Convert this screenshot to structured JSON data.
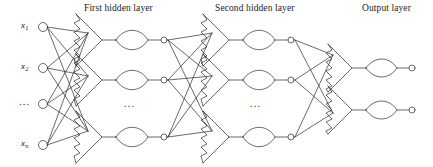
{
  "figure": {
    "type": "diagram",
    "background_color": "#ffffff",
    "stroke_color": "#2a2a2a"
  },
  "titles": {
    "first_hidden": "First hidden layer",
    "second_hidden": "Second hidden layer",
    "output": "Output layer"
  },
  "input_layer": {
    "labels": [
      {
        "base": "x",
        "sub": "1"
      },
      {
        "base": "x",
        "sub": "2"
      },
      {
        "base": "",
        "sub": ""
      },
      {
        "base": "x",
        "sub": "n"
      }
    ],
    "ellipsis": "...",
    "node_count_visible": 4
  },
  "ellipses": {
    "first_hidden": "...",
    "second_hidden": "...",
    "input": "..."
  },
  "layers": [
    {
      "name": "input",
      "nodes": 4,
      "x": 42
    },
    {
      "name": "first-hidden",
      "nodes": 3,
      "x": 165
    },
    {
      "name": "second-hidden",
      "nodes": 3,
      "x": 292
    },
    {
      "name": "output",
      "nodes": 2,
      "x": 412
    }
  ]
}
